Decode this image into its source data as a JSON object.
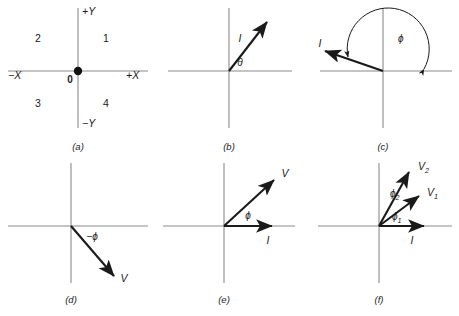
{
  "figure": {
    "background_color": "#ffffff",
    "axis_color": "#8a8a8a",
    "vector_color": "#1a1a1a",
    "panels": [
      {
        "id": "a",
        "caption": "(a)",
        "axis_labels": {
          "plus_x": "+X",
          "minus_x": "−X",
          "plus_y": "+Y",
          "minus_y": "−Y"
        },
        "origin_label": "0",
        "quadrants": [
          "1",
          "2",
          "3",
          "4"
        ]
      },
      {
        "id": "b",
        "caption": "(b)",
        "vector_label": "I",
        "angle_label": "θ"
      },
      {
        "id": "c",
        "caption": "(c)",
        "vector_label": "I",
        "angle_label": "ϕ"
      },
      {
        "id": "d",
        "caption": "(d)",
        "vector_label": "V",
        "angle_label": "−ϕ"
      },
      {
        "id": "e",
        "caption": "(e)",
        "vector_labels": {
          "current": "I",
          "voltage": "V"
        },
        "angle_label": "ϕ"
      },
      {
        "id": "f",
        "caption": "(f)",
        "vector_labels": {
          "current": "I",
          "voltage_1": "V",
          "voltage_1_sub": "1",
          "voltage_2": "V",
          "voltage_2_sub": "2"
        },
        "angle_labels": {
          "phi_1": "ϕ",
          "phi_1_sub": "1",
          "phi_2": "ϕ",
          "phi_2_sub": "2"
        }
      }
    ]
  }
}
